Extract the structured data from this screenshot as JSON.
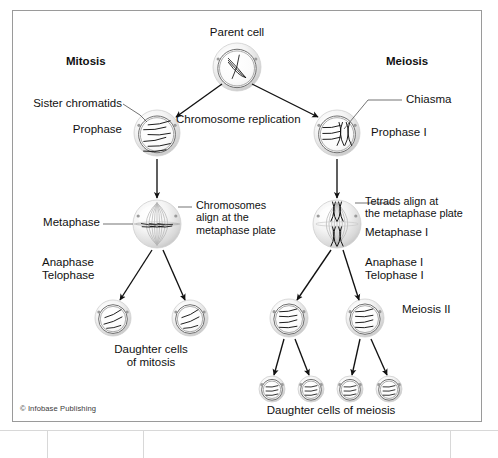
{
  "figure": {
    "title_parent": "Parent cell",
    "credit": "© Infobase Publishing",
    "frame_color": "#9a9a9a",
    "ink_color": "#111111",
    "cell_fill": "#f2f2f2",
    "cell_edge": "#8c8c8c"
  },
  "columns": {
    "left_heading": "Mitosis",
    "right_heading": "Meiosis"
  },
  "labels": {
    "sister_chromatids": "Sister chromatids",
    "prophase": "Prophase",
    "chromosome_replication": "Chromosome replication",
    "chiasma": "Chiasma",
    "prophase_i": "Prophase I",
    "metaphase": "Metaphase",
    "chromosomes_align": "Chromosomes\nalign at the\nmetaphase plate",
    "tetrads_align": "Tetrads align at\nthe metaphase plate",
    "metaphase_i": "Metaphase I",
    "anaphase_telophase": "Anaphase\nTelophase",
    "anaphase_telophase_i": "Anaphase I\nTelophase I",
    "meiosis_ii": "Meiosis II",
    "daughter_cells_mitosis": "Daughter cells\nof mitosis",
    "daughter_cells_meiosis": "Daughter cells of meiosis"
  },
  "cells": [
    {
      "id": "parent",
      "name": "parent-cell",
      "cx": 237,
      "cy": 67,
      "r": 24,
      "kind": "interphase"
    },
    {
      "id": "prophase",
      "name": "prophase-cell",
      "cx": 157,
      "cy": 133,
      "r": 23,
      "kind": "prophase"
    },
    {
      "id": "prophase1",
      "name": "prophase-i-cell",
      "cx": 337,
      "cy": 133,
      "r": 23,
      "kind": "prophase1"
    },
    {
      "id": "metaphase",
      "name": "metaphase-cell",
      "cx": 157,
      "cy": 224,
      "r": 24,
      "kind": "metaphase"
    },
    {
      "id": "metaphase1",
      "name": "metaphase-i-cell",
      "cx": 337,
      "cy": 224,
      "r": 24,
      "kind": "metaphase1"
    },
    {
      "id": "dm1",
      "name": "daughter-cell-mitosis-1",
      "cx": 113,
      "cy": 318,
      "r": 18,
      "kind": "daughter"
    },
    {
      "id": "dm2",
      "name": "daughter-cell-mitosis-2",
      "cx": 190,
      "cy": 318,
      "r": 18,
      "kind": "daughter"
    },
    {
      "id": "mi1",
      "name": "meiosis-ii-cell-1",
      "cx": 289,
      "cy": 318,
      "r": 19,
      "kind": "meiosis2"
    },
    {
      "id": "mi2",
      "name": "meiosis-ii-cell-2",
      "cx": 365,
      "cy": 318,
      "r": 19,
      "kind": "meiosis2"
    },
    {
      "id": "gm1",
      "name": "gamete-cell-1",
      "cx": 272,
      "cy": 389,
      "r": 13,
      "kind": "gamete"
    },
    {
      "id": "gm2",
      "name": "gamete-cell-2",
      "cx": 311,
      "cy": 389,
      "r": 13,
      "kind": "gamete"
    },
    {
      "id": "gm3",
      "name": "gamete-cell-3",
      "cx": 350,
      "cy": 389,
      "r": 13,
      "kind": "gamete"
    },
    {
      "id": "gm4",
      "name": "gamete-cell-4",
      "cx": 389,
      "cy": 389,
      "r": 13,
      "kind": "gamete"
    }
  ],
  "arrows": [
    {
      "name": "arrow-parent-to-prophase",
      "x1": 222,
      "y1": 84,
      "x2": 176,
      "y2": 117
    },
    {
      "name": "arrow-parent-to-prophase-i",
      "x1": 252,
      "y1": 84,
      "x2": 318,
      "y2": 117
    },
    {
      "name": "arrow-prophase-to-metaphase",
      "x1": 157,
      "y1": 159,
      "x2": 157,
      "y2": 198
    },
    {
      "name": "arrow-prophase-i-to-metaphase-i",
      "x1": 337,
      "y1": 159,
      "x2": 337,
      "y2": 198
    },
    {
      "name": "arrow-metaphase-to-daughter-1",
      "x1": 152,
      "y1": 250,
      "x2": 120,
      "y2": 300
    },
    {
      "name": "arrow-metaphase-to-daughter-2",
      "x1": 163,
      "y1": 250,
      "x2": 185,
      "y2": 300
    },
    {
      "name": "arrow-metaphase-i-to-meiosis-1",
      "x1": 331,
      "y1": 250,
      "x2": 297,
      "y2": 300
    },
    {
      "name": "arrow-metaphase-i-to-meiosis-2",
      "x1": 343,
      "y1": 250,
      "x2": 359,
      "y2": 300
    },
    {
      "name": "arrow-meiosis-1-to-gamete-1",
      "x1": 284,
      "y1": 339,
      "x2": 274,
      "y2": 375
    },
    {
      "name": "arrow-meiosis-1-to-gamete-2",
      "x1": 295,
      "y1": 339,
      "x2": 309,
      "y2": 375
    },
    {
      "name": "arrow-meiosis-2-to-gamete-3",
      "x1": 360,
      "y1": 339,
      "x2": 352,
      "y2": 375
    },
    {
      "name": "arrow-meiosis-2-to-gamete-4",
      "x1": 371,
      "y1": 339,
      "x2": 387,
      "y2": 375
    }
  ],
  "leaders": [
    {
      "name": "leader-sister-chromatids",
      "pts": "123,104 140,115 147,122"
    },
    {
      "name": "leader-chiasma",
      "pts": "402,100 368,100 344,129"
    },
    {
      "name": "leader-chromosomes-align",
      "pts": "192,207 178,207"
    },
    {
      "name": "leader-tetrads-align",
      "pts": "393,203 355,203"
    },
    {
      "name": "leader-metaphase",
      "pts": "103,224 133,224"
    }
  ]
}
